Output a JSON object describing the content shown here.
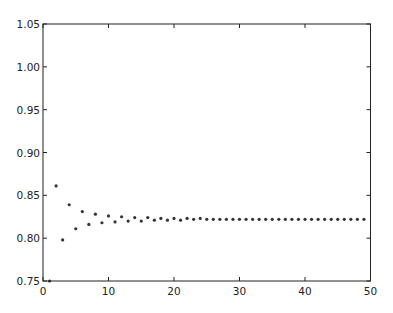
{
  "chart_data": {
    "type": "scatter",
    "title": "",
    "xlabel": "",
    "ylabel": "",
    "xlim": [
      0,
      50
    ],
    "ylim": [
      0.75,
      1.05
    ],
    "grid": false,
    "legend": null,
    "xticks": [
      0,
      10,
      20,
      30,
      40,
      50
    ],
    "xtick_labels": [
      "0",
      "10",
      "20",
      "30",
      "40",
      "50"
    ],
    "yticks": [
      0.75,
      0.8,
      0.85,
      0.9,
      0.95,
      1.0,
      1.05
    ],
    "ytick_labels": [
      "0.75",
      "0.80",
      "0.85",
      "0.90",
      "0.95",
      "1.00",
      "1.05"
    ],
    "marker_color": "#333333",
    "series": [
      {
        "name": "sequence",
        "x": [
          1,
          2,
          3,
          4,
          5,
          6,
          7,
          8,
          9,
          10,
          11,
          12,
          13,
          14,
          15,
          16,
          17,
          18,
          19,
          20,
          21,
          22,
          23,
          24,
          25,
          26,
          27,
          28,
          29,
          30,
          31,
          32,
          33,
          34,
          35,
          36,
          37,
          38,
          39,
          40,
          41,
          42,
          43,
          44,
          45,
          46,
          47,
          48,
          49
        ],
        "y": [
          0.75,
          0.861,
          0.798,
          0.839,
          0.811,
          0.831,
          0.816,
          0.828,
          0.818,
          0.826,
          0.819,
          0.825,
          0.82,
          0.824,
          0.82,
          0.824,
          0.821,
          0.823,
          0.821,
          0.823,
          0.821,
          0.823,
          0.822,
          0.823,
          0.822,
          0.822,
          0.822,
          0.822,
          0.822,
          0.822,
          0.822,
          0.822,
          0.822,
          0.822,
          0.822,
          0.822,
          0.822,
          0.822,
          0.822,
          0.822,
          0.822,
          0.822,
          0.822,
          0.822,
          0.822,
          0.822,
          0.822,
          0.822,
          0.822
        ]
      }
    ]
  }
}
